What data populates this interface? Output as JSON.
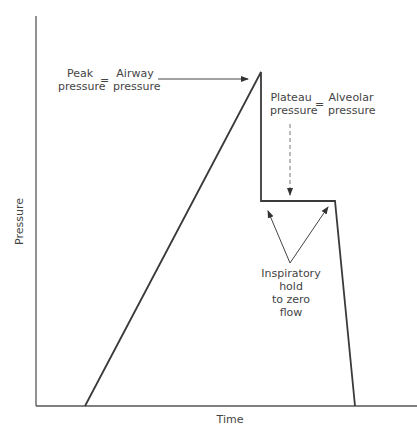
{
  "diagram": {
    "axes": {
      "xlabel": "Time",
      "ylabel": "Pressure"
    },
    "annotations": {
      "peak": {
        "left_line1": "Peak",
        "left_line2": "pressure",
        "equals": "=",
        "right_line1": "Airway",
        "right_line2": "pressure"
      },
      "plateau": {
        "left_line1": "Plateau",
        "left_line2": "pressure",
        "equals": "=",
        "right_line1": "Alveolar",
        "right_line2": "pressure"
      },
      "hold": {
        "line1": "Inspiratory",
        "line2": "hold",
        "line3": "to zero",
        "line4": "flow"
      }
    },
    "colors": {
      "line": "#3a3a3a",
      "axis": "#555555",
      "dashed": "#777777"
    },
    "waveform_points": [
      [
        85,
        406
      ],
      [
        261,
        72
      ],
      [
        261,
        201
      ],
      [
        335,
        201
      ],
      [
        355,
        406
      ]
    ]
  }
}
